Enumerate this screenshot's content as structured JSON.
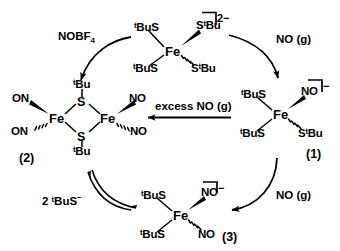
{
  "scheme": {
    "title": "Nitrosylation cycle of tetrathiolatoferrate",
    "structures": [
      {
        "id": "top",
        "name": "tetrakis-tert-butylthiolato-ferrate",
        "charge": "2−",
        "metal": "Fe",
        "ligands": [
          "ᵗBuS",
          "SᵗBu",
          "ᵗBuS",
          "SᵗBu"
        ],
        "label": ""
      },
      {
        "id": "one",
        "name": "mononitrosyl-tris-thiolato-ferrate",
        "charge": "−",
        "metal": "Fe",
        "ligands": [
          "ᵗBuS",
          "NO",
          "ᵗBuS",
          "SᵗBu"
        ],
        "label": "(1)"
      },
      {
        "id": "two",
        "name": "roussin-red-ester-dimer",
        "charge": "",
        "metal": "Fe",
        "ligands": [
          "ON",
          "ON",
          "NO",
          "NO"
        ],
        "bridges": [
          "ᵗBu",
          "ᵗBu"
        ],
        "bridge_atoms": [
          "S",
          "S"
        ],
        "label": "(2)"
      },
      {
        "id": "three",
        "name": "dinitrosyl-iron-complex",
        "charge": "−",
        "metal": "Fe",
        "ligands": [
          "ᵗBuS",
          "NO",
          "ᵗBuS",
          "NO"
        ],
        "label": "(3)"
      }
    ],
    "arrows": [
      {
        "id": "top-left",
        "name": "nobf4-arrow",
        "label": "NOBF",
        "label_sub": "4"
      },
      {
        "id": "top-right",
        "name": "no-gas-arrow-top",
        "label": "NO (g)",
        "label_sub": ""
      },
      {
        "id": "mid",
        "name": "excess-no-arrow",
        "label": "excess NO (g)",
        "label_sub": ""
      },
      {
        "id": "bottom-right",
        "name": "no-gas-arrow-bottom",
        "label": "NO (g)",
        "label_sub": ""
      },
      {
        "id": "bottom-left",
        "name": "thiolate-equilibrium-arrow",
        "label": "2 ᵗBuS",
        "label_sup": "−"
      }
    ],
    "atoms": {
      "fe": "Fe",
      "s": "S",
      "no": "NO",
      "on": "ON",
      "tbus": "ᵗBuS",
      "stbu": "SᵗBu",
      "tbu": "ᵗBu"
    },
    "colors": {
      "ink": "#000000",
      "background": "#ffffff"
    }
  }
}
